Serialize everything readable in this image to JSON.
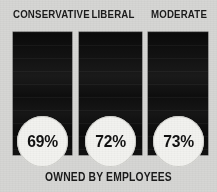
{
  "chart_data": {
    "type": "bar",
    "title": "",
    "subtitle": "",
    "xlabel": "",
    "ylabel": "",
    "caption": "OWNED BY EMPLOYEES",
    "categories": [
      "CONSERVATIVE",
      "LIBERAL",
      "MODERATE"
    ],
    "values": [
      69,
      72,
      73
    ],
    "value_labels": [
      "69%",
      "72%",
      "73%"
    ],
    "value_unit": "%",
    "ylim": [
      0,
      100
    ],
    "grid": false,
    "legend": false,
    "series": [
      {
        "name": "Owned by employees",
        "values": [
          69,
          72,
          73
        ]
      }
    ],
    "bars": [
      {
        "category": "CONSERVATIVE",
        "value": 69,
        "label": "69%"
      },
      {
        "category": "LIBERAL",
        "value": 72,
        "label": "72%"
      },
      {
        "category": "MODERATE",
        "value": 73,
        "label": "73%"
      }
    ]
  },
  "colors": {
    "background": "#d6d6d4",
    "bar": "#0d0d0d",
    "circle_fill": "#f2f2ef",
    "text": "#1b1b1b"
  }
}
